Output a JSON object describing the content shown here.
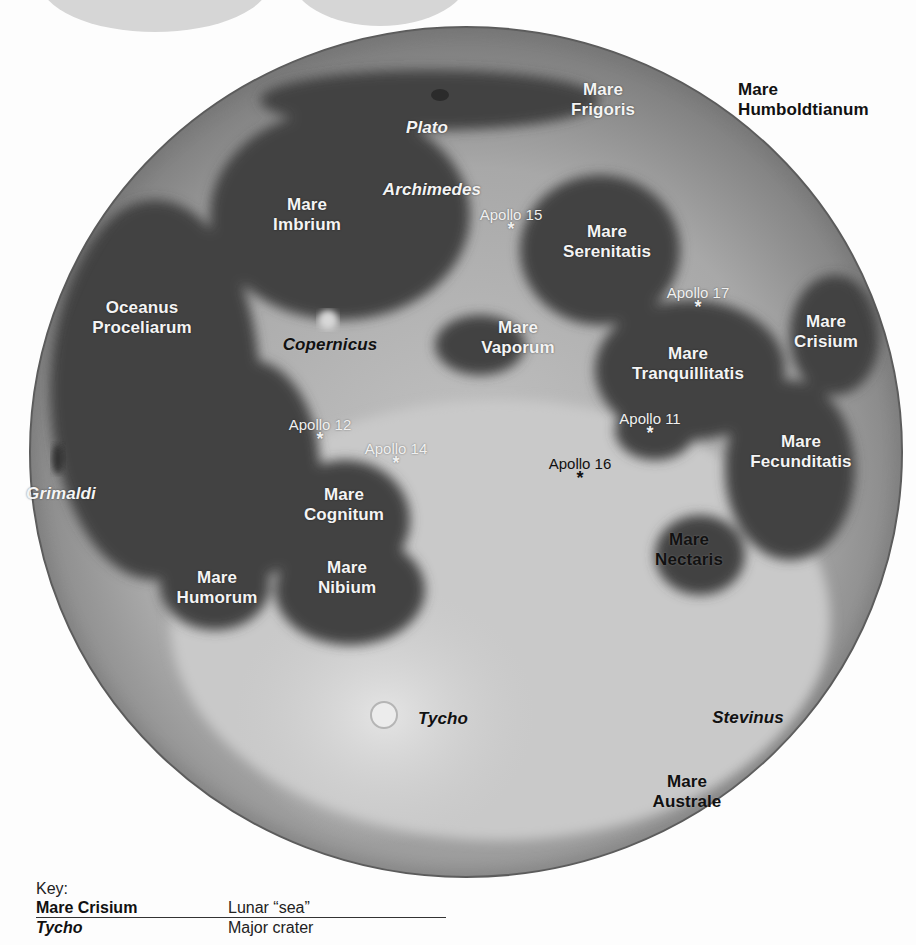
{
  "map": {
    "subject": "Near side of the Moon",
    "colors": {
      "background": "#fdfdfd",
      "moon_highland": "#a9a9a9",
      "moon_mare": "#3f3f3f",
      "cloud": "#d6d6d6",
      "label_light": "#f4f4f4",
      "label_dark": "#111111"
    },
    "maria": [
      {
        "id": "frigoris",
        "line1": "Mare",
        "line2": "Frigoris",
        "style": "white"
      },
      {
        "id": "humboldtianum",
        "line1": "Mare",
        "line2": "Humboldtianum",
        "style": "black"
      },
      {
        "id": "imbrium",
        "line1": "Mare",
        "line2": "Imbrium",
        "style": "white"
      },
      {
        "id": "serenitatis",
        "line1": "Mare",
        "line2": "Serenitatis",
        "style": "white"
      },
      {
        "id": "proceliarum",
        "line1": "Oceanus",
        "line2": "Proceliarum",
        "style": "white"
      },
      {
        "id": "vaporum",
        "line1": "Mare",
        "line2": "Vaporum",
        "style": "white"
      },
      {
        "id": "crisium",
        "line1": "Mare",
        "line2": "Crisium",
        "style": "white"
      },
      {
        "id": "tranquillitatis",
        "line1": "Mare",
        "line2": "Tranquillitatis",
        "style": "white"
      },
      {
        "id": "fecunditatis",
        "line1": "Mare",
        "line2": "Fecunditatis",
        "style": "white"
      },
      {
        "id": "cognitum",
        "line1": "Mare",
        "line2": "Cognitum",
        "style": "white"
      },
      {
        "id": "nectaris",
        "line1": "Mare",
        "line2": "Nectaris",
        "style": "black"
      },
      {
        "id": "humorum",
        "line1": "Mare",
        "line2": "Humorum",
        "style": "white"
      },
      {
        "id": "nibium",
        "line1": "Mare",
        "line2": "Nibium",
        "style": "white"
      },
      {
        "id": "australe",
        "line1": "Mare",
        "line2": "Australe",
        "style": "black"
      }
    ],
    "craters": [
      {
        "id": "plato",
        "label": "Plato",
        "style": "white"
      },
      {
        "id": "archimedes",
        "label": "Archimedes",
        "style": "white"
      },
      {
        "id": "copernicus",
        "label": "Copernicus",
        "style": "black"
      },
      {
        "id": "grimaldi",
        "label": "Grimaldi",
        "style": "white"
      },
      {
        "id": "tycho",
        "label": "Tycho",
        "style": "black"
      },
      {
        "id": "stevinus",
        "label": "Stevinus",
        "style": "black"
      }
    ],
    "landing_sites": [
      {
        "id": "apollo15",
        "label": "Apollo 15",
        "marker": "*"
      },
      {
        "id": "apollo17",
        "label": "Apollo 17",
        "marker": "*"
      },
      {
        "id": "apollo12",
        "label": "Apollo 12",
        "marker": "*"
      },
      {
        "id": "apollo14",
        "label": "Apollo 14",
        "marker": "*"
      },
      {
        "id": "apollo11",
        "label": "Apollo 11",
        "marker": "*"
      },
      {
        "id": "apollo16",
        "label": "Apollo 16",
        "marker": "*"
      }
    ]
  },
  "key": {
    "title": "Key:",
    "rows": [
      {
        "term": "Mare Crisium",
        "description": "Lunar “sea”"
      },
      {
        "term": "Tycho",
        "description": "Major crater"
      }
    ]
  }
}
